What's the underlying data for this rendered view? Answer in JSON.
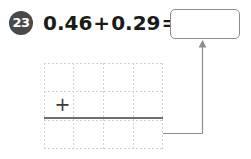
{
  "worksheet": {
    "problem_number": "23",
    "equation": {
      "addend_1": "0.46",
      "operator": "+",
      "addend_2": "0.29",
      "equals": "=",
      "full_text": "0.46+0.29="
    },
    "answer_box": {
      "value": "",
      "placeholder": "",
      "state": "empty"
    },
    "arrow": {
      "name": "up-arrow",
      "direction": "up",
      "points_to": "answer-box",
      "from": "column-addition-sum-line"
    },
    "grid": {
      "columns": 4,
      "rows": 3,
      "plus_sign": "+",
      "sum_rule": true,
      "cells": [
        [
          "",
          "",
          "",
          ""
        ],
        [
          "",
          "",
          "",
          ""
        ],
        [
          "",
          "",
          "",
          ""
        ]
      ]
    },
    "colors": {
      "badge_fill": "#4a4a4a",
      "badge_text": "#ffffff",
      "equation_text": "#1a1a1a",
      "answer_box_border": "#8d8d8d",
      "grid_line": "#d2d2d2",
      "sum_rule": "#6e6e6e",
      "connector": "#8d8d8d",
      "background": "#ffffff"
    }
  }
}
